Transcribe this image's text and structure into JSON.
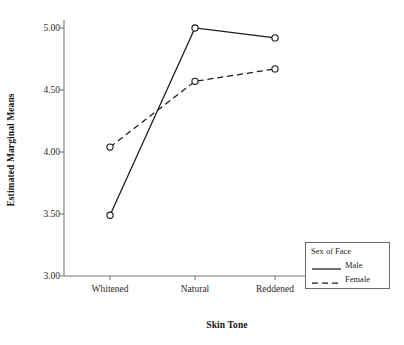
{
  "chart_data": {
    "type": "line",
    "title": "",
    "xlabel": "Skin Tone",
    "ylabel": "Estimated Marginal Means",
    "categories": [
      "Whitened",
      "Natural",
      "Reddened"
    ],
    "series": [
      {
        "name": "Male",
        "values": [
          3.49,
          5.0,
          4.92
        ],
        "linestyle": "solid",
        "color": "#1a1a1a",
        "marker": "open-circle"
      },
      {
        "name": "Female",
        "values": [
          4.04,
          4.57,
          4.67
        ],
        "linestyle": "dashed",
        "color": "#1a1a1a",
        "marker": "open-circle"
      }
    ],
    "ylim": [
      3.0,
      5.0
    ],
    "yticks": [
      "3.00",
      "3.50",
      "4.00",
      "4.50",
      "5.00"
    ],
    "ytick_values": [
      3.0,
      3.5,
      4.0,
      4.5,
      5.0
    ],
    "grid": false,
    "legend": {
      "title": "Sex of Face",
      "position": "lower-right",
      "entries": [
        "Male",
        "Female"
      ]
    }
  },
  "axes": {
    "y_title": "Estimated Marginal Means",
    "x_title": "Skin Tone"
  },
  "legend": {
    "title": "Sex of Face",
    "items": [
      {
        "label": "Male",
        "style": "solid"
      },
      {
        "label": "Female",
        "style": "dashed"
      }
    ]
  },
  "colors": {
    "line": "#1a1a1a",
    "axis": "#777777",
    "text": "#1f1f1f",
    "legend_border": "#6a6a6a",
    "background": "#ffffff"
  }
}
